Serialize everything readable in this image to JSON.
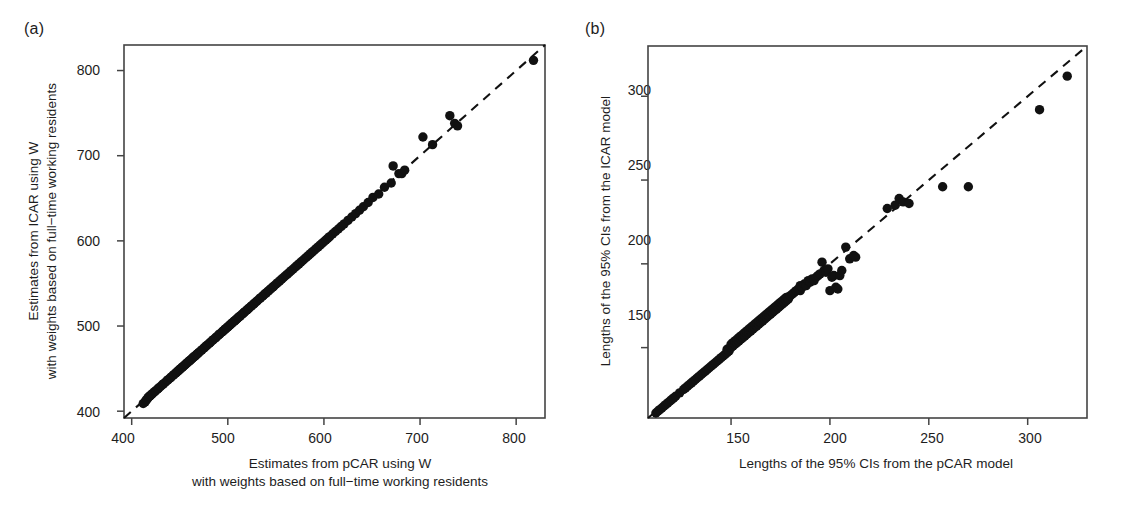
{
  "figure": {
    "background_color": "#ffffff",
    "ink_color": "#1a1a1a",
    "point_color": "#111111",
    "frame_color": "#444444"
  },
  "panels": [
    {
      "key": "a",
      "label": "(a)",
      "xlabel_line1": "Estimates from pCAR using W",
      "xlabel_line2": "with weights based on full−time working residents",
      "ylabel_line1": "Estimates from ICAR using W",
      "ylabel_line2": "with weights based on full−time working residents",
      "xticks": [
        400,
        500,
        600,
        700,
        800
      ],
      "yticks": [
        400,
        500,
        600,
        700,
        800
      ],
      "xticklabels": [
        "400",
        "500",
        "600",
        "700",
        "800"
      ],
      "yticklabels": [
        "400",
        "500",
        "600",
        "700",
        "800"
      ]
    },
    {
      "key": "b",
      "label": "(b)",
      "xlabel_line1": "Lengths of the 95% CIs from the pCAR model",
      "xlabel_line2": "",
      "ylabel_line1": "Lengths of the 95% CIs from the ICAR model",
      "ylabel_line2": "",
      "xticks": [
        150,
        200,
        250,
        300
      ],
      "yticks": [
        150,
        200,
        250,
        300
      ],
      "xticklabels": [
        "150",
        "200",
        "250",
        "300"
      ],
      "yticklabels": [
        "150",
        "200",
        "250",
        "300"
      ]
    }
  ],
  "chart_data": [
    {
      "type": "scatter",
      "panel": "a",
      "title": "",
      "xlabel": "Estimates from pCAR using W with weights based on full−time working residents",
      "ylabel": "Estimates from ICAR using W with weights based on full−time working residents",
      "xlim": [
        392,
        830
      ],
      "ylim": [
        392,
        830
      ],
      "xticks": [
        400,
        500,
        600,
        700,
        800
      ],
      "yticks": [
        400,
        500,
        600,
        700,
        800
      ],
      "grid": false,
      "legend": "none",
      "marker": "filled-circle",
      "marker_size_px": 7,
      "reference_line": {
        "type": "identity",
        "style": "dashed",
        "label": "y = x",
        "from": [
          392,
          392
        ],
        "to": [
          830,
          830
        ]
      },
      "x": [
        412,
        414,
        415,
        416,
        417,
        418,
        419,
        420,
        421,
        422,
        424,
        425,
        427,
        428,
        430,
        432,
        433,
        435,
        437,
        438,
        440,
        441,
        443,
        444,
        446,
        447,
        448,
        449,
        450,
        451,
        452,
        453,
        454,
        455,
        456,
        457,
        458,
        459,
        460,
        461,
        462,
        463,
        464,
        465,
        466,
        467,
        468,
        469,
        470,
        472,
        473,
        475,
        476,
        478,
        479,
        481,
        482,
        484,
        485,
        487,
        488,
        490,
        491,
        492,
        494,
        495,
        496,
        497,
        498,
        499,
        500,
        501,
        502,
        503,
        504,
        505,
        506,
        507,
        508,
        509,
        510,
        511,
        512,
        513,
        515,
        516,
        517,
        518,
        520,
        521,
        522,
        524,
        525,
        527,
        528,
        530,
        531,
        533,
        534,
        536,
        537,
        539,
        540,
        542,
        543,
        545,
        547,
        548,
        550,
        552,
        554,
        556,
        558,
        560,
        562,
        564,
        566,
        568,
        570,
        572,
        574,
        576,
        578,
        580,
        582,
        584,
        586,
        588,
        590,
        592,
        594,
        596,
        598,
        600,
        602,
        604,
        606,
        609,
        612,
        615,
        618,
        621,
        625,
        629,
        633,
        637,
        641,
        646,
        651,
        657,
        663,
        670,
        672,
        678,
        681,
        684,
        703,
        713,
        731,
        736,
        739,
        818
      ],
      "y": [
        409,
        411,
        413,
        414,
        416,
        417,
        418,
        419,
        420,
        421,
        423,
        424,
        426,
        427,
        429,
        431,
        432,
        434,
        436,
        437,
        439,
        440,
        442,
        443,
        445,
        446,
        447,
        448,
        449,
        450,
        451,
        452,
        453,
        454,
        455,
        456,
        457,
        458,
        459,
        460,
        461,
        462,
        463,
        464,
        465,
        466,
        467,
        468,
        469,
        471,
        472,
        474,
        475,
        477,
        478,
        480,
        481,
        483,
        484,
        486,
        487,
        489,
        490,
        491,
        493,
        494,
        495,
        496,
        497,
        498,
        499,
        500,
        501,
        502,
        503,
        504,
        505,
        506,
        507,
        508,
        509,
        510,
        511,
        512,
        514,
        515,
        516,
        517,
        519,
        520,
        521,
        523,
        524,
        526,
        527,
        529,
        530,
        532,
        533,
        535,
        536,
        538,
        539,
        541,
        542,
        544,
        546,
        547,
        549,
        551,
        553,
        555,
        557,
        559,
        561,
        563,
        565,
        567,
        569,
        571,
        573,
        575,
        577,
        579,
        581,
        583,
        585,
        587,
        589,
        591,
        593,
        595,
        597,
        599,
        601,
        603,
        605,
        608,
        611,
        614,
        617,
        620,
        624,
        628,
        632,
        636,
        640,
        645,
        651,
        655,
        663,
        668,
        688,
        679,
        679,
        683,
        722,
        713,
        747,
        738,
        735,
        812
      ]
    },
    {
      "type": "scatter",
      "panel": "b",
      "title": "",
      "xlabel": "Lengths of the 95% CIs from the pCAR model",
      "ylabel": "Lengths of the 95% CIs from the ICAR model",
      "xlim": [
        108,
        330
      ],
      "ylim": [
        108,
        330
      ],
      "xticks": [
        150,
        200,
        250,
        300
      ],
      "yticks": [
        150,
        200,
        250,
        300
      ],
      "grid": false,
      "legend": "none",
      "marker": "filled-circle",
      "marker_size_px": 7,
      "reference_line": {
        "type": "identity",
        "style": "dashed",
        "label": "y = x",
        "from": [
          108,
          108
        ],
        "to": [
          330,
          330
        ]
      },
      "x": [
        112,
        113,
        114,
        115,
        116,
        117,
        118,
        119,
        120,
        121,
        122,
        124,
        126,
        127,
        128,
        129,
        130,
        131,
        132,
        133,
        134,
        135,
        136,
        137,
        138,
        139,
        140,
        141,
        142,
        143,
        144,
        145,
        146,
        147,
        148,
        148,
        149,
        150,
        150,
        151,
        151,
        152,
        152,
        153,
        153,
        154,
        154,
        155,
        155,
        156,
        156,
        157,
        157,
        158,
        158,
        159,
        159,
        160,
        160,
        161,
        161,
        162,
        162,
        163,
        163,
        164,
        164,
        165,
        165,
        166,
        166,
        167,
        167,
        168,
        168,
        169,
        169,
        170,
        170,
        171,
        171,
        172,
        172,
        173,
        173,
        174,
        174,
        175,
        175,
        176,
        176,
        177,
        177,
        178,
        178,
        179,
        180,
        181,
        182,
        183,
        184,
        185,
        185,
        186,
        187,
        188,
        189,
        190,
        191,
        192,
        193,
        194,
        195,
        196,
        197,
        198,
        199,
        200,
        201,
        202,
        203,
        204,
        205,
        206,
        208,
        210,
        212,
        213,
        229,
        233,
        235,
        237,
        240,
        257,
        270,
        306,
        320
      ],
      "y": [
        111,
        112,
        113,
        114,
        115,
        116,
        117,
        118,
        119,
        120,
        121,
        123,
        125,
        126,
        127,
        128,
        129,
        130,
        131,
        132,
        133,
        134,
        135,
        136,
        137,
        138,
        139,
        140,
        141,
        142,
        143,
        144,
        145,
        146,
        147,
        149,
        148,
        150,
        152,
        151,
        153,
        152,
        154,
        153,
        155,
        154,
        156,
        155,
        157,
        156,
        158,
        157,
        159,
        158,
        160,
        159,
        161,
        160,
        162,
        161,
        163,
        162,
        164,
        163,
        165,
        164,
        166,
        165,
        167,
        166,
        168,
        167,
        169,
        168,
        170,
        169,
        171,
        170,
        172,
        171,
        173,
        172,
        174,
        173,
        175,
        174,
        176,
        175,
        177,
        176,
        178,
        177,
        179,
        178,
        180,
        179,
        181,
        182,
        183,
        184,
        185,
        184,
        187,
        186,
        188,
        187,
        190,
        189,
        191,
        190,
        192,
        193,
        194,
        201,
        196,
        195,
        197,
        184,
        192,
        193,
        186,
        185,
        193,
        196,
        210,
        203,
        205,
        204,
        233,
        235,
        239,
        237,
        236,
        246,
        246,
        292,
        312
      ]
    }
  ]
}
